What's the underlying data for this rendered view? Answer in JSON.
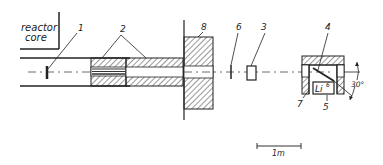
{
  "diagram": {
    "region_label_line1": "reactor",
    "region_label_line2": "core",
    "callouts": {
      "c1": "1",
      "c2": "2",
      "c3": "3",
      "c4": "4",
      "c5": "5",
      "c6": "6",
      "c7": "7",
      "c8": "8"
    },
    "sample_label": "Li",
    "sample_superscript": "6",
    "angle_label": "30°",
    "scale_label": "1m",
    "colors": {
      "ink": "#222222",
      "background": "#ffffff"
    }
  }
}
